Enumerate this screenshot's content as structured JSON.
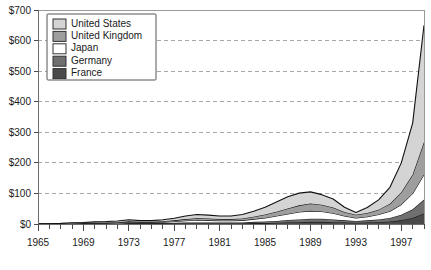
{
  "chart_data": {
    "type": "area",
    "stacked": true,
    "title": "",
    "subtitle": "",
    "xlabel": "",
    "ylabel": "",
    "grid": true,
    "legend_position": "top-left",
    "xlim": [
      1965,
      1999
    ],
    "ylim": [
      0,
      700
    ],
    "y_ticks": [
      0,
      100,
      200,
      300,
      400,
      500,
      600,
      700
    ],
    "y_tick_labels": [
      "$0",
      "$100",
      "$200",
      "$300",
      "$400",
      "$500",
      "$600",
      "$700"
    ],
    "x_ticks": [
      1965,
      1969,
      1973,
      1977,
      1981,
      1985,
      1989,
      1993,
      1997
    ],
    "x_tick_labels": [
      "1965",
      "1969",
      "1973",
      "1977",
      "1981",
      "1985",
      "1989",
      "1993",
      "1997"
    ],
    "x": [
      1965,
      1966,
      1967,
      1968,
      1969,
      1970,
      1971,
      1972,
      1973,
      1974,
      1975,
      1976,
      1977,
      1978,
      1979,
      1980,
      1981,
      1982,
      1983,
      1984,
      1985,
      1986,
      1987,
      1988,
      1989,
      1990,
      1991,
      1992,
      1993,
      1994,
      1995,
      1996,
      1997,
      1998,
      1999
    ],
    "series": [
      {
        "name": "France",
        "color": "#4a4a4a",
        "values": [
          0,
          0,
          0,
          0,
          0,
          1,
          1,
          1,
          1,
          1,
          1,
          1,
          2,
          2,
          2,
          2,
          2,
          2,
          2,
          3,
          3,
          4,
          5,
          6,
          7,
          7,
          6,
          5,
          4,
          5,
          6,
          8,
          12,
          20,
          34
        ]
      },
      {
        "name": "Germany",
        "color": "#6f6f6f",
        "values": [
          0,
          0,
          0,
          1,
          1,
          1,
          1,
          1,
          2,
          2,
          2,
          2,
          2,
          3,
          3,
          3,
          3,
          3,
          3,
          4,
          5,
          6,
          8,
          9,
          10,
          10,
          9,
          7,
          6,
          7,
          9,
          12,
          18,
          28,
          46
        ]
      },
      {
        "name": "Japan",
        "color": "#ffffff",
        "values": [
          0,
          0,
          0,
          0,
          1,
          1,
          1,
          2,
          4,
          2,
          2,
          3,
          4,
          6,
          8,
          7,
          6,
          6,
          7,
          9,
          12,
          16,
          20,
          24,
          26,
          24,
          20,
          14,
          10,
          12,
          16,
          22,
          34,
          52,
          82
        ]
      },
      {
        "name": "United Kingdom",
        "color": "#9e9e9e",
        "values": [
          0,
          0,
          1,
          1,
          1,
          1,
          2,
          2,
          2,
          2,
          2,
          3,
          4,
          5,
          6,
          6,
          5,
          5,
          6,
          8,
          11,
          14,
          18,
          22,
          24,
          22,
          19,
          13,
          10,
          12,
          16,
          24,
          40,
          62,
          106
        ]
      },
      {
        "name": "United States",
        "color": "#d4d4d4",
        "values": [
          1,
          1,
          1,
          2,
          2,
          3,
          3,
          4,
          5,
          4,
          4,
          5,
          7,
          10,
          12,
          11,
          10,
          10,
          13,
          18,
          24,
          32,
          38,
          40,
          38,
          33,
          28,
          16,
          8,
          18,
          32,
          54,
          96,
          168,
          382
        ]
      }
    ]
  },
  "legend": {
    "items": [
      {
        "label": "United States",
        "color": "#d4d4d4"
      },
      {
        "label": "United Kingdom",
        "color": "#9e9e9e"
      },
      {
        "label": "Japan",
        "color": "#ffffff"
      },
      {
        "label": "Germany",
        "color": "#6f6f6f"
      },
      {
        "label": "France",
        "color": "#4a4a4a"
      }
    ]
  }
}
